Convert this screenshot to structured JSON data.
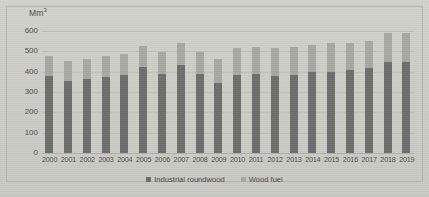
{
  "chart_data": {
    "type": "bar",
    "stacked": true,
    "title": "",
    "subtitle": "",
    "xlabel": "",
    "ylabel": "Mm3",
    "ylabel_display": "Mm",
    "ylabel_superscript": "3",
    "ylim": [
      0,
      600
    ],
    "yticks": [
      0,
      100,
      200,
      300,
      400,
      500,
      600
    ],
    "ytick_labels": [
      "0",
      "100",
      "200",
      "300",
      "400",
      "500",
      "600"
    ],
    "grid": true,
    "grid_axis": "y",
    "legend_position": "bottom",
    "categories": [
      "2000",
      "2001",
      "2002",
      "2003",
      "2004",
      "2005",
      "2006",
      "2007",
      "2008",
      "2009",
      "2010",
      "2011",
      "2012",
      "2013",
      "2014",
      "2015",
      "2016",
      "2017",
      "2018",
      "2019"
    ],
    "series": [
      {
        "name": "Industrial roundwood",
        "color": "#6e6e6e",
        "values": [
          380,
          355,
          362,
          375,
          385,
          425,
          388,
          435,
          387,
          345,
          383,
          390,
          380,
          383,
          397,
          400,
          410,
          420,
          448,
          450
        ]
      },
      {
        "name": "Wood fuel",
        "color": "#a8a8a2",
        "values": [
          95,
          100,
          102,
          103,
          102,
          103,
          110,
          108,
          112,
          118,
          133,
          130,
          138,
          136,
          135,
          140,
          132,
          132,
          140,
          140
        ]
      }
    ],
    "totals": [
      475,
      455,
      464,
      478,
      487,
      528,
      498,
      543,
      499,
      463,
      516,
      520,
      518,
      519,
      532,
      540,
      542,
      552,
      588,
      590
    ]
  },
  "legend": {
    "items": [
      {
        "label": "Industrial roundwood",
        "color": "#6e6e6e"
      },
      {
        "label": "Wood fuel",
        "color": "#a8a8a2"
      }
    ]
  },
  "colors": {
    "background": "#cfcfc9",
    "plot_border": "#b4b4ae",
    "gridline": "#c0c0ba",
    "text": "#4a4a4a",
    "industrial_roundwood": "#6e6e6e",
    "wood_fuel": "#a8a8a2"
  }
}
